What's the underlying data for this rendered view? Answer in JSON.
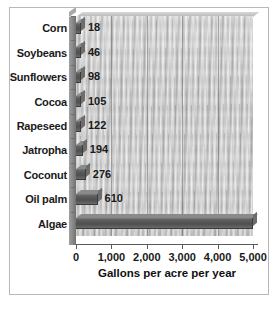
{
  "chart_data": {
    "type": "bar",
    "orientation": "horizontal",
    "title": "",
    "xlabel": "Gallons per acre per year",
    "ylabel": "",
    "xlim": [
      0,
      5000
    ],
    "grid": true,
    "legend": "none",
    "xticks": [
      "0",
      "1,000",
      "2,000",
      "3,000",
      "4,000",
      "5,000"
    ],
    "xtick_values": [
      0,
      1000,
      2000,
      3000,
      4000,
      5000
    ],
    "categories": [
      "Corn",
      "Soybeans",
      "Sunflowers",
      "Cocoa",
      "Rapeseed",
      "Jatropha",
      "Coconut",
      "Oil palm",
      "Algae"
    ],
    "values": [
      18,
      46,
      98,
      105,
      122,
      194,
      276,
      610,
      5000
    ],
    "data_labels": [
      "18",
      "46",
      "98",
      "105",
      "122",
      "194",
      "276",
      "610",
      ""
    ],
    "bars": [
      {
        "category": "Corn",
        "value": 18,
        "label": "18"
      },
      {
        "category": "Soybeans",
        "value": 46,
        "label": "46"
      },
      {
        "category": "Sunflowers",
        "value": 98,
        "label": "98"
      },
      {
        "category": "Cocoa",
        "value": 105,
        "label": "105"
      },
      {
        "category": "Rapeseed",
        "value": 122,
        "label": "122"
      },
      {
        "category": "Jatropha",
        "value": 194,
        "label": "194"
      },
      {
        "category": "Coconut",
        "value": 276,
        "label": "276"
      },
      {
        "category": "Oil palm",
        "value": 610,
        "label": "610"
      },
      {
        "category": "Algae",
        "value": 5000,
        "label": ""
      }
    ],
    "colors": {
      "bar": "#565656",
      "plot_background": "#c2c2c2",
      "gridline": "#6e6e6e",
      "axis": "#5a5a5a",
      "text": "#1a1a1a",
      "frame_border": "#b8b8b8",
      "page_background": "#ffffff"
    }
  }
}
